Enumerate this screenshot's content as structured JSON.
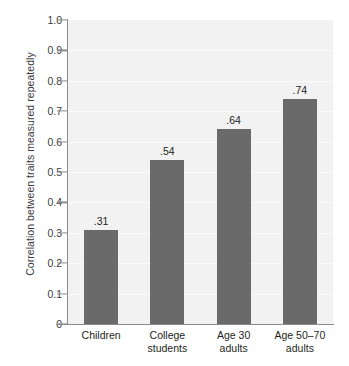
{
  "chart_data": {
    "type": "bar",
    "title": "",
    "subtitle": "",
    "xlabel": "",
    "ylabel": "Correlation between traits measured repeatedly",
    "categories": [
      "Children",
      "College students",
      "Age 30 adults",
      "Age 50–70 adults"
    ],
    "category_lines": [
      [
        "Children"
      ],
      [
        "College",
        "students"
      ],
      [
        "Age 30",
        "adults"
      ],
      [
        "Age 50–70",
        "adults"
      ]
    ],
    "values": [
      0.31,
      0.54,
      0.64,
      0.74
    ],
    "data_labels": [
      ".31",
      ".54",
      ".64",
      ".74"
    ],
    "ylim": [
      0,
      1.0
    ],
    "yticks": [
      0,
      0.1,
      0.2,
      0.3,
      0.4,
      0.5,
      0.6,
      0.7,
      0.8,
      0.9,
      1.0
    ],
    "ytick_labels": [
      "0",
      "0.1",
      "0.2",
      "0.3",
      "0.4",
      "0.5",
      "0.6",
      "0.7",
      "0.8",
      "0.9",
      "1.0"
    ],
    "grid": true,
    "grid_axis": "y",
    "legend": false,
    "legend_position": "none",
    "colors": {
      "bar": "#6a6a6a",
      "plot_background": "#f2f2f2",
      "page_background": "#ffffff",
      "gridline": "#fbfbfb",
      "axis": "#8c8c8c",
      "text": "#231f20",
      "tick_text": "#3a3a3a"
    }
  }
}
